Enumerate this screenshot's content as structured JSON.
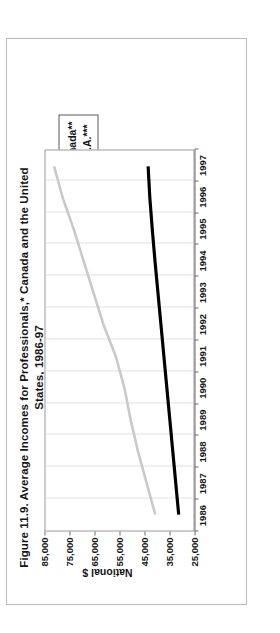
{
  "figure": {
    "title_line1": "Figure 11.9.  Average Incomes for Professionals,* Canada and the United",
    "title_line2": "States, 1986-97"
  },
  "legend": {
    "position": "top-right",
    "items": [
      {
        "label": "Canada**",
        "color": "#000000",
        "icon": "line-swatch-canada"
      },
      {
        "label": "U.S.A.***",
        "color": "#c9c9c9",
        "icon": "line-swatch-usa"
      }
    ]
  },
  "axes": {
    "y_title": "National $",
    "y_ticks": [
      "85,000",
      "75,000",
      "65,000",
      "55,000",
      "45,000",
      "35,000",
      "25,000"
    ],
    "x_ticks": [
      "1986",
      "1987",
      "1988",
      "1989",
      "1990",
      "1991",
      "1992",
      "1993",
      "1994",
      "1995",
      "1996",
      "1997"
    ]
  },
  "chart_data": {
    "type": "line",
    "title": "Figure 11.9.  Average Incomes for Professionals,* Canada and the United States, 1986-97",
    "xlabel": "",
    "ylabel": "National $",
    "x": [
      1986,
      1987,
      1988,
      1989,
      1990,
      1991,
      1992,
      1993,
      1994,
      1995,
      1996,
      1997
    ],
    "ylim": [
      25000,
      85000
    ],
    "ytick_values": [
      85000,
      75000,
      65000,
      55000,
      45000,
      35000,
      25000
    ],
    "grid": "vertical",
    "legend_position": "top-right",
    "series": [
      {
        "name": "Canada**",
        "color": "#000000",
        "values": [
          31000,
          32200,
          33400,
          34600,
          35800,
          37000,
          38200,
          39400,
          40600,
          41700,
          42700,
          43400
        ]
      },
      {
        "name": "U.S.A.***",
        "color": "#c9c9c9",
        "values": [
          40500,
          44000,
          47500,
          50500,
          53000,
          56500,
          61500,
          65500,
          69500,
          73500,
          78000,
          81500
        ]
      }
    ]
  }
}
